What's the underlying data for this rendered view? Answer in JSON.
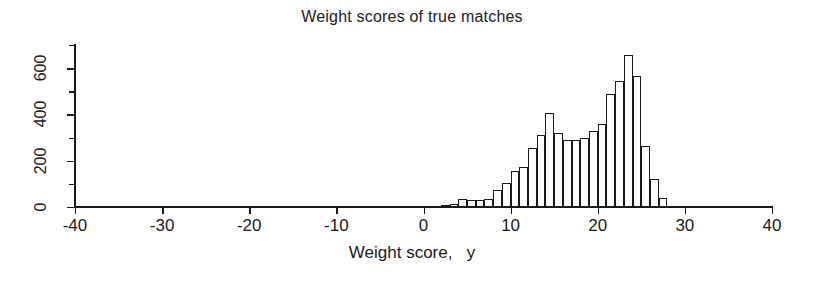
{
  "chart_data": {
    "type": "bar",
    "title": "Weight scores of true matches",
    "xlabel": "Weight score,   y",
    "ylabel": "",
    "xlim": [
      -40,
      40
    ],
    "ylim": [
      0,
      700
    ],
    "grid": false,
    "legend": null,
    "bin_width": 1,
    "x_ticks": [
      -40,
      -30,
      -20,
      -10,
      0,
      10,
      20,
      30,
      40
    ],
    "x_tick_labels": [
      "-40",
      "-30",
      "-20",
      "-10",
      "0",
      "10",
      "20",
      "30",
      "40"
    ],
    "y_ticks": [
      0,
      200,
      400,
      600
    ],
    "y_tick_labels": [
      "0",
      "200",
      "400",
      "600"
    ],
    "y_minor_ticks": [
      100,
      300,
      500,
      700
    ],
    "bar_color": "#ffffff",
    "bar_edge_color": "#1a1a1a",
    "categories": [
      2.5,
      3.5,
      4.5,
      5.5,
      6.5,
      7.5,
      8.5,
      9.5,
      10.5,
      11.5,
      12.5,
      13.5,
      14.5,
      15.5,
      16.5,
      17.5,
      18.5,
      19.5,
      20.5,
      21.5,
      22.5,
      23.5,
      24.5,
      25.5,
      26.5,
      27.5
    ],
    "values": [
      8,
      12,
      35,
      30,
      32,
      35,
      75,
      105,
      155,
      175,
      255,
      310,
      405,
      320,
      290,
      290,
      300,
      330,
      360,
      490,
      545,
      655,
      565,
      265,
      120,
      40
    ],
    "bins": [
      {
        "left": 2,
        "right": 3,
        "count": 8
      },
      {
        "left": 3,
        "right": 4,
        "count": 12
      },
      {
        "left": 4,
        "right": 5,
        "count": 35
      },
      {
        "left": 5,
        "right": 6,
        "count": 30
      },
      {
        "left": 6,
        "right": 7,
        "count": 32
      },
      {
        "left": 7,
        "right": 8,
        "count": 35
      },
      {
        "left": 8,
        "right": 9,
        "count": 75
      },
      {
        "left": 9,
        "right": 10,
        "count": 105
      },
      {
        "left": 10,
        "right": 11,
        "count": 155
      },
      {
        "left": 11,
        "right": 12,
        "count": 175
      },
      {
        "left": 12,
        "right": 13,
        "count": 255
      },
      {
        "left": 13,
        "right": 14,
        "count": 310
      },
      {
        "left": 14,
        "right": 15,
        "count": 405
      },
      {
        "left": 15,
        "right": 16,
        "count": 320
      },
      {
        "left": 16,
        "right": 17,
        "count": 290
      },
      {
        "left": 17,
        "right": 18,
        "count": 290
      },
      {
        "left": 18,
        "right": 19,
        "count": 300
      },
      {
        "left": 19,
        "right": 20,
        "count": 330
      },
      {
        "left": 20,
        "right": 21,
        "count": 360
      },
      {
        "left": 21,
        "right": 22,
        "count": 490
      },
      {
        "left": 22,
        "right": 23,
        "count": 545
      },
      {
        "left": 23,
        "right": 24,
        "count": 655
      },
      {
        "left": 24,
        "right": 25,
        "count": 565
      },
      {
        "left": 25,
        "right": 26,
        "count": 265
      },
      {
        "left": 26,
        "right": 27,
        "count": 120
      },
      {
        "left": 27,
        "right": 28,
        "count": 40
      }
    ]
  }
}
